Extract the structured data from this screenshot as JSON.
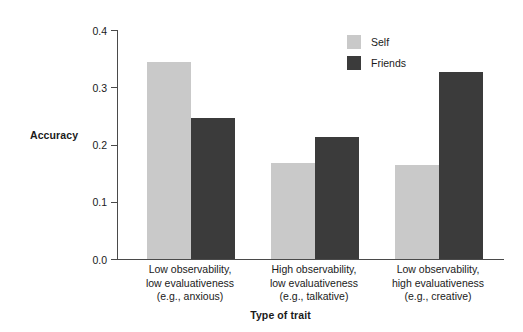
{
  "chart_data": {
    "type": "bar",
    "title": "",
    "xlabel": "Type of trait",
    "ylabel": "Accuracy",
    "ylim": [
      0.0,
      0.4
    ],
    "yticks": [
      "0.0",
      "0.1",
      "0.2",
      "0.3",
      "0.4"
    ],
    "ytick_values": [
      0.0,
      0.1,
      0.2,
      0.3,
      0.4
    ],
    "grid": false,
    "legend_position": "top-right",
    "categories": [
      "Low observability,\nlow evaluativeness\n(e.g., anxious)",
      "High observability,\nlow evaluativeness\n(e.g., talkative)",
      "Low observability,\nhigh evaluativeness\n(e.g., creative)"
    ],
    "category_lines": [
      [
        "Low observability,",
        "low evaluativeness",
        "(e.g., anxious)"
      ],
      [
        "High observability,",
        "low evaluativeness",
        "(e.g., talkative)"
      ],
      [
        "Low observability,",
        "high evaluativeness",
        "(e.g., creative)"
      ]
    ],
    "series": [
      {
        "name": "Self",
        "color": "#c9c9c9",
        "values": [
          0.344,
          0.168,
          0.165
        ]
      },
      {
        "name": "Friends",
        "color": "#3b3b3b",
        "values": [
          0.246,
          0.213,
          0.327
        ]
      }
    ]
  },
  "legend": {
    "items": [
      {
        "label": "Self"
      },
      {
        "label": "Friends"
      }
    ]
  },
  "axes": {
    "y_title": "Accuracy",
    "x_title": "Type of trait"
  },
  "colors": {
    "self": "#c9c9c9",
    "friends": "#3b3b3b",
    "axis": "#4a4a4a",
    "text": "#1a1a1a",
    "background": "#ffffff"
  }
}
